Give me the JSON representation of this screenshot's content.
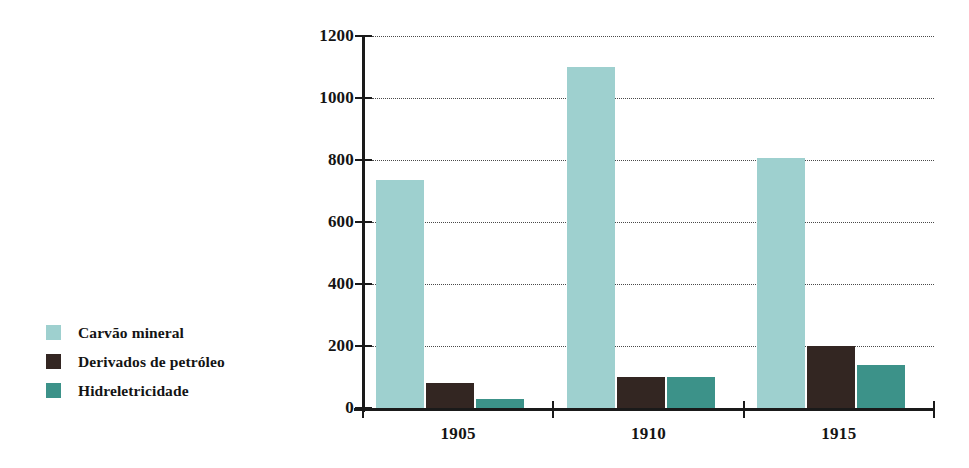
{
  "chart_data": {
    "type": "bar",
    "title": "",
    "subtitle": "",
    "xlabel": "",
    "ylabel": "",
    "categories": [
      "1905",
      "1910",
      "1915"
    ],
    "series": [
      {
        "name": "Carvão mineral",
        "color": "#9ed0cf",
        "values": [
          735,
          1100,
          805
        ]
      },
      {
        "name": "Derivados de petróleo",
        "color": "#332622",
        "values": [
          80,
          100,
          200
        ]
      },
      {
        "name": "Hidreletricidade",
        "color": "#3c9289",
        "values": [
          28,
          100,
          140
        ]
      }
    ],
    "ylim": [
      0,
      1200
    ],
    "ytick_values": [
      0,
      200,
      400,
      600,
      800,
      1000,
      1200
    ],
    "ytick_labels": [
      "0",
      "200",
      "400",
      "600",
      "800",
      "1000",
      "1200"
    ],
    "grid": true,
    "grid_style": "dotted",
    "legend_position": "left",
    "background": "#ffffff",
    "axis_color": "#1a1a1a"
  },
  "legend": {
    "items": [
      {
        "label": "Carvão mineral"
      },
      {
        "label": "Derivados de petróleo"
      },
      {
        "label": "Hidreletricidade"
      }
    ]
  }
}
